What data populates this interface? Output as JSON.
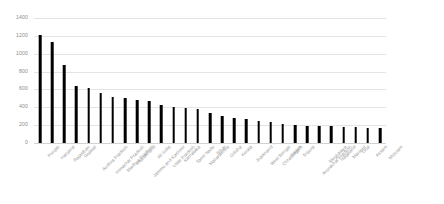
{
  "chart_data": {
    "type": "bar",
    "title": "",
    "subtitle": "",
    "xlabel": "",
    "ylabel": "",
    "ylim": [
      0,
      1400
    ],
    "yticks": [
      0,
      200,
      400,
      600,
      800,
      1000,
      1200,
      1400
    ],
    "ytick_labels": [
      "0",
      "200",
      "400",
      "600",
      "800",
      "1000",
      "1200",
      "1400"
    ],
    "grid": true,
    "legend": "none",
    "bar_color": "#000000",
    "gridline_color": "#e4e4e4",
    "tick_label_color": "#9a9a9a",
    "categories": [
      "Punjab",
      "Haryana",
      "Rajasthan",
      "Gujarat",
      "Andhra Pradesh",
      "Himachal Pradesh",
      "Madhya Pradesh",
      "Uttarakhand",
      "Jammu and Kashmir",
      "All India",
      "Uttar Pradesh",
      "Karnataka",
      "Tamil Nadu",
      "Maharashtra",
      "Bihar",
      "Odisha",
      "Kerala",
      "Jharkhand",
      "West Bengal",
      "Chhattisgarh",
      "Sikkim",
      "Tripura",
      "Arunachal Pradesh",
      "Meghalaya",
      "Nagaland",
      "Manipur",
      "Goa",
      "Assam",
      "Mizoram"
    ],
    "values": [
      1210,
      1130,
      870,
      640,
      620,
      560,
      520,
      500,
      480,
      470,
      430,
      400,
      390,
      380,
      340,
      300,
      280,
      270,
      250,
      230,
      210,
      200,
      195,
      190,
      185,
      180,
      175,
      170,
      165
    ]
  }
}
